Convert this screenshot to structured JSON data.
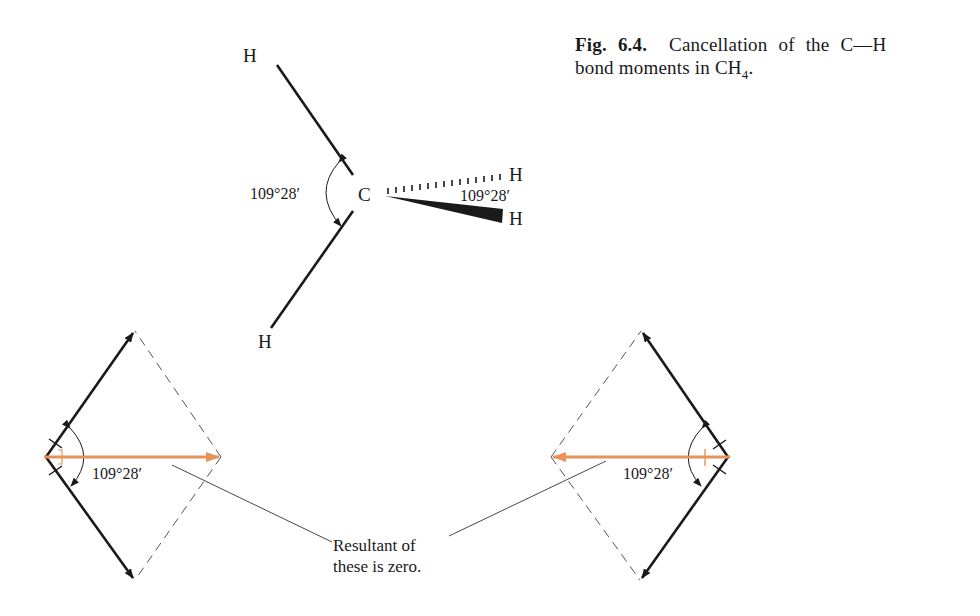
{
  "caption": {
    "figure_number": "Fig. 6.4.",
    "line1_text": "Cancellation of the C—H",
    "line2_prefix": "bond moments in CH",
    "line2_subscript": "4",
    "line2_suffix": "."
  },
  "molecule": {
    "central_atom": "C",
    "atom_top_left": "H",
    "atom_bottom_left": "H",
    "atom_dashed_right": "H",
    "atom_wedge_right": "H",
    "angle_left": "109°28′",
    "angle_right": "109°28′"
  },
  "left_parallelogram": {
    "angle": "109°28′"
  },
  "right_parallelogram": {
    "angle": "109°28′"
  },
  "annotation": {
    "line1": "Resultant of",
    "line2": "these is zero."
  },
  "colors": {
    "ink": "#1a1a1a",
    "resultant": "#e8925a",
    "dashed": "#555555"
  }
}
